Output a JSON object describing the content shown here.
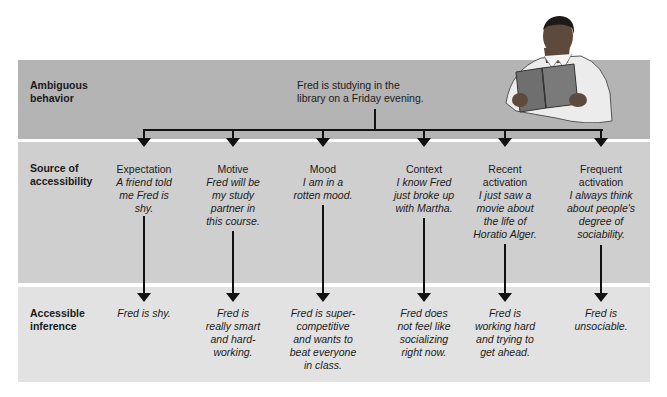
{
  "rows": {
    "ambiguous_behavior": "Ambiguous\nbehavior",
    "source_of_accessibility": "Source of\naccessibility",
    "accessible_inference": "Accessible\ninference"
  },
  "behavior_text": "Fred is studying in the\nlibrary on a Friday evening.",
  "illustration": "man-reading-book",
  "columns": [
    {
      "name": "Expectation",
      "example": "A friend told\nme Fred is\nshy.",
      "inference": "Fred is shy."
    },
    {
      "name": "Motive",
      "example": "Fred will be\nmy study\npartner in\nthis course.",
      "inference": "Fred is\nreally smart\nand hard-\nworking."
    },
    {
      "name": "Mood",
      "example": "I am in a\nrotten mood.",
      "inference": "Fred is super-\ncompetitive\nand wants to\nbeat everyone\nin class."
    },
    {
      "name": "Context",
      "example": "I know Fred\njust broke up\nwith Martha.",
      "inference": "Fred does\nnot feel like\nsocializing\nright now."
    },
    {
      "name": "Recent\nactivation",
      "example": "I just saw a\nmovie about\nthe life of\nHoratio Alger.",
      "inference": "Fred is\nworking hard\nand trying to\nget ahead."
    },
    {
      "name": "Frequent\nactivation",
      "example": "I always think\nabout people's\ndegree of\nsociability.",
      "inference": "Fred is\nunsociable."
    }
  ],
  "colors": {
    "band_top": "#b4b4b4",
    "band_middle": "#cfcfcf",
    "band_bottom": "#e2e2e2",
    "arrow": "#111111"
  }
}
